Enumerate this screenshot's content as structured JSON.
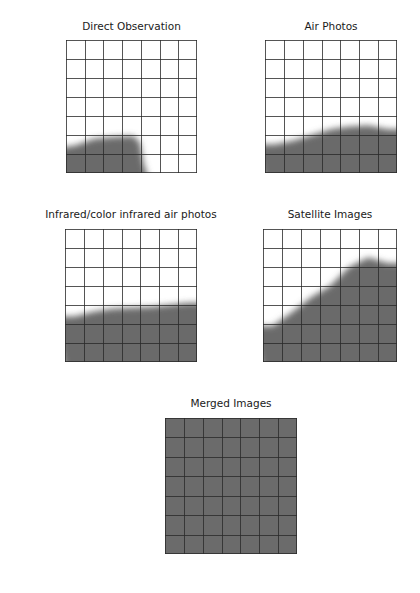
{
  "chart_data": [
    {
      "type": "area",
      "title": "Direct Observation",
      "x_categories": [
        "hours",
        "days",
        "weeks",
        "months",
        "seasons",
        "years",
        "decades"
      ],
      "y_categories": [
        "quadrangle",
        "county",
        "several counties",
        "states/ provinces",
        "nations",
        "continents",
        "globe hemisphere"
      ],
      "coverage_rows": [
        1.4,
        1.75,
        1.9,
        1.9,
        0.0,
        0.0,
        0.0
      ],
      "grid": true,
      "note": "shaded region height measured in grid rows from bottom (0-7)"
    },
    {
      "type": "area",
      "title": "Air Photos",
      "x_categories": [
        "hours",
        "days",
        "weeks",
        "months",
        "seasons",
        "years",
        "decades"
      ],
      "y_categories": [
        "quadrangle",
        "county",
        "several counties",
        "states/ provinces",
        "nations",
        "continents",
        "globe hemisphere"
      ],
      "coverage_rows": [
        1.5,
        1.7,
        2.0,
        2.3,
        2.45,
        2.5,
        2.3
      ],
      "grid": true
    },
    {
      "type": "area",
      "title": "Infrared/color infrared air photos",
      "x_categories": [
        "hours",
        "days",
        "weeks",
        "months",
        "seasons",
        "years",
        "decades"
      ],
      "y_categories": [
        "quadrangle",
        "county",
        "several counties",
        "states/ provinces",
        "nations",
        "continents",
        "globe hemisphere"
      ],
      "coverage_rows": [
        2.4,
        2.65,
        2.8,
        2.85,
        2.9,
        3.0,
        3.1
      ],
      "grid": true
    },
    {
      "type": "area",
      "title": "Satellite Images",
      "x_categories": [
        "hours",
        "days",
        "weeks",
        "months",
        "seasons",
        "years",
        "decades"
      ],
      "y_categories": [
        "quadrangle",
        "county",
        "several counties",
        "states/ provinces",
        "nations",
        "continents",
        "globe hemisphere"
      ],
      "coverage_rows": [
        1.9,
        2.6,
        3.4,
        4.0,
        5.0,
        5.5,
        5.2
      ],
      "grid": true
    },
    {
      "type": "area",
      "title": "Merged Images",
      "x_categories": [
        "hours",
        "days",
        "weeks",
        "months",
        "seasons",
        "years",
        "decades"
      ],
      "y_categories": [
        "quadrangle",
        "county",
        "several counties",
        "states/ provinces",
        "nations",
        "continents",
        "globe hemisphere"
      ],
      "coverage_rows": [
        7,
        7,
        7,
        7,
        7,
        7,
        7
      ],
      "grid": true
    }
  ],
  "labels": {
    "y": [
      "globe\nhemisphere",
      "continents",
      "nations",
      "states/\nprovinces",
      "several\ncounties",
      "county",
      "quadrangle"
    ],
    "x": [
      "hours",
      "days",
      "weeks",
      "months",
      "seasons",
      "years",
      "decades"
    ]
  },
  "style": {
    "shade_color": "#6b6b6b",
    "grid_color": "#2a2a2a"
  }
}
